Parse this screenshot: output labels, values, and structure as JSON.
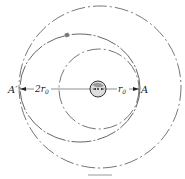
{
  "diagram": {
    "labels": {
      "apogee": "A′",
      "perigee": "A",
      "outer_radius": "2r",
      "outer_radius_sub": "0",
      "inner_radius": "r",
      "inner_radius_sub": "0"
    },
    "caption": "",
    "colors": {
      "line": "#555555",
      "earth": "#bbbbbb"
    }
  }
}
